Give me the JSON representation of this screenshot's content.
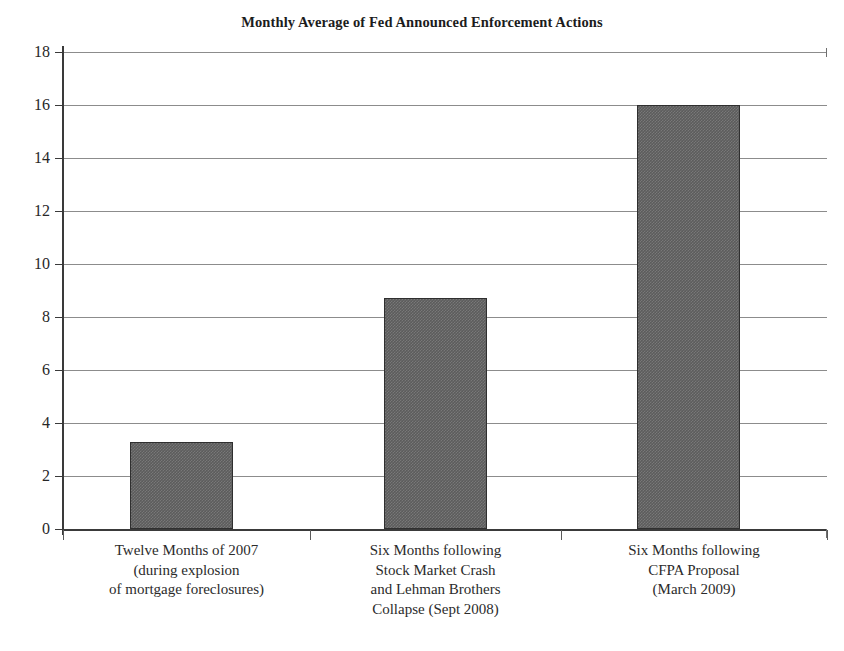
{
  "chart_data": {
    "type": "bar",
    "title": "Monthly Average of Fed Announced Enforcement Actions",
    "xlabel": "",
    "ylabel": "",
    "ylim": [
      0,
      18
    ],
    "ytick_step": 2,
    "grid": true,
    "legend": "none",
    "bar_color": "#5c5c5c",
    "categories": [
      "Twelve Months of 2007 (during explosion of mortgage foreclosures)",
      "Six Months following Stock Market Crash and Lehman Brothers Collapse (Sept 2008)",
      "Six Months following CFPA Proposal (March 2009)"
    ],
    "category_lines": [
      [
        "Twelve Months of 2007",
        "(during explosion",
        "of mortgage foreclosures)"
      ],
      [
        "Six Months following",
        "Stock Market Crash",
        "and Lehman Brothers",
        "Collapse (Sept 2008)"
      ],
      [
        "Six Months following",
        "CFPA Proposal",
        "(March 2009)"
      ]
    ],
    "values": [
      3.3,
      8.7,
      16.0
    ],
    "ytick_labels": [
      "18",
      "16",
      "14",
      "12",
      "10",
      "8",
      "6",
      "4",
      "2",
      "0"
    ],
    "ytick_values": [
      18,
      16,
      14,
      12,
      10,
      8,
      6,
      4,
      2,
      0
    ]
  }
}
